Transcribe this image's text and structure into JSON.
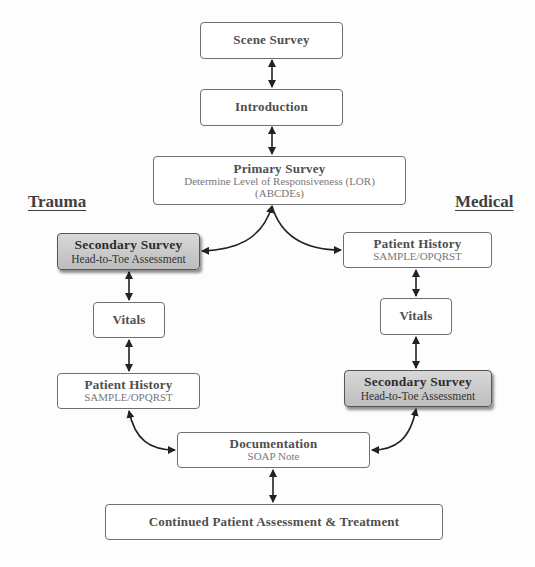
{
  "headings": {
    "left": "Trauma",
    "right": "Medical"
  },
  "nodes": {
    "scene_survey": {
      "title": "Scene Survey"
    },
    "introduction": {
      "title": "Introduction"
    },
    "primary_survey": {
      "title": "Primary Survey",
      "sub1": "Determine Level of Responsiveness (LOR)",
      "sub2": "(ABCDEs)"
    },
    "trauma_secondary": {
      "title": "Secondary Survey",
      "sub": "Head-to-Toe Assessment"
    },
    "trauma_vitals": {
      "title": "Vitals"
    },
    "trauma_history": {
      "title": "Patient History",
      "sub": "SAMPLE/OPQRST"
    },
    "medical_history": {
      "title": "Patient History",
      "sub": "SAMPLE/OPQRST"
    },
    "medical_vitals": {
      "title": "Vitals"
    },
    "medical_secondary": {
      "title": "Secondary Survey",
      "sub": "Head-to-Toe Assessment"
    },
    "documentation": {
      "title": "Documentation",
      "sub": "SOAP Note"
    },
    "continued": {
      "title": "Continued Patient Assessment & Treatment"
    }
  },
  "colors": {
    "border": "#6f6f6f",
    "shaded_fill": "#c8c8c8",
    "arrow": "#222222"
  }
}
